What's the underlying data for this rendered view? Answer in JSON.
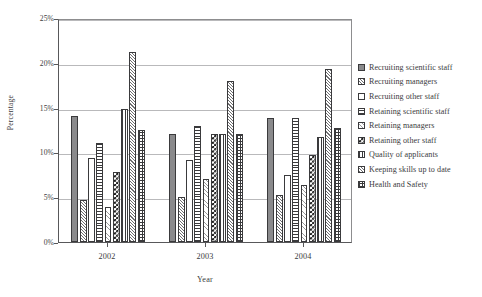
{
  "chart_data": {
    "type": "bar",
    "title": "",
    "xlabel": "Year",
    "ylabel": "Percentage",
    "categories": [
      "2002",
      "2003",
      "2004"
    ],
    "ylim": [
      0,
      25
    ],
    "ytick_labels": [
      "0%",
      "5%",
      "10%",
      "15%",
      "20%",
      "25%"
    ],
    "ytick_values": [
      0,
      5,
      10,
      15,
      20,
      25
    ],
    "grid": "horizontal",
    "legend_position": "right",
    "unit": "%",
    "series": [
      {
        "name": "Recruiting scientific staff",
        "pattern": "solid-gray",
        "values": [
          14.1,
          12.0,
          13.8
        ]
      },
      {
        "name": "Recruiting managers",
        "pattern": "diagonal",
        "values": [
          4.7,
          5.0,
          5.3
        ]
      },
      {
        "name": "Recruiting other staff",
        "pattern": "white",
        "values": [
          9.4,
          9.1,
          7.5
        ]
      },
      {
        "name": "Retaining scientific staff",
        "pattern": "horizontal",
        "values": [
          11.0,
          12.9,
          13.8
        ]
      },
      {
        "name": "Retaining managers",
        "pattern": "diagonal-light",
        "values": [
          3.9,
          7.0,
          6.4
        ]
      },
      {
        "name": "Retaining other staff",
        "pattern": "checkerboard",
        "values": [
          7.8,
          12.0,
          9.7
        ]
      },
      {
        "name": "Quality of applicants",
        "pattern": "vertical",
        "values": [
          14.9,
          12.0,
          11.7
        ]
      },
      {
        "name": "Keeping skills up to date",
        "pattern": "diagonal-2",
        "values": [
          21.2,
          18.0,
          19.3
        ]
      },
      {
        "name": "Health and Safety",
        "pattern": "grid",
        "values": [
          12.5,
          12.0,
          12.7
        ]
      }
    ]
  }
}
